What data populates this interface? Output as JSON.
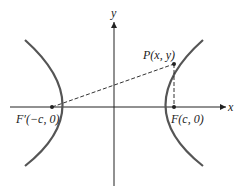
{
  "diagram": {
    "type": "hyperbola-foci",
    "axes": {
      "x_label": "x",
      "y_label": "y"
    },
    "points": {
      "left_focus": "F′(−c, 0)",
      "right_focus": "F(c, 0)",
      "point_on_curve": "P(x, y)"
    },
    "colors": {
      "curve": "#555555",
      "axes": "#222222",
      "dashed": "#333333"
    }
  }
}
